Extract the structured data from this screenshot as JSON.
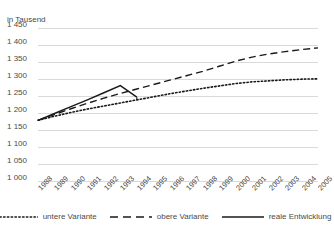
{
  "chart_data": {
    "type": "line",
    "title": "",
    "subtitle": "",
    "unit_label": "in Tausend",
    "xlabel": "",
    "ylabel": "",
    "ylim": [
      1000,
      1450
    ],
    "ytick_step": 50,
    "ytick_labels": [
      "1 450",
      "1 400",
      "1 350",
      "1 300",
      "1 250",
      "1 200",
      "1 150",
      "1 100",
      "1 050",
      "1 000"
    ],
    "ytick_values": [
      1450,
      1400,
      1350,
      1300,
      1250,
      1200,
      1150,
      1100,
      1050,
      1000
    ],
    "grid": true,
    "grid_color": "#d9d9d9",
    "legend_position": "bottom",
    "categories": [
      "1988",
      "1989",
      "1990",
      "1991",
      "1992",
      "1993",
      "1994",
      "1995",
      "1996",
      "1997",
      "1998",
      "1999",
      "2000",
      "2001",
      "2002",
      "2003",
      "2004",
      "2005"
    ],
    "x": [
      1988,
      1989,
      1990,
      1991,
      1992,
      1993,
      1994,
      1995,
      1996,
      1997,
      1998,
      1999,
      2000,
      2001,
      2002,
      2003,
      2004,
      2005
    ],
    "series": [
      {
        "name": "untere Variante",
        "style": "dotted",
        "color": "#1a1a1a",
        "values": [
          1180,
          1192,
          1203,
          1213,
          1222,
          1231,
          1240,
          1249,
          1258,
          1266,
          1274,
          1281,
          1288,
          1293,
          1296,
          1299,
          1301,
          1302
        ]
      },
      {
        "name": "obere Variante",
        "style": "dashed",
        "color": "#1a1a1a",
        "values": [
          1180,
          1197,
          1214,
          1230,
          1245,
          1259,
          1272,
          1285,
          1298,
          1311,
          1324,
          1339,
          1354,
          1366,
          1375,
          1382,
          1388,
          1393
        ]
      },
      {
        "name": "reale Entwicklung",
        "style": "solid",
        "color": "#1a1a1a",
        "values": [
          1180,
          1200,
          1220,
          1240,
          1261,
          1282,
          1248,
          null,
          null,
          null,
          null,
          null,
          null,
          null,
          null,
          null,
          null,
          null
        ]
      }
    ]
  },
  "legend": {
    "items": [
      {
        "label": "untere Variante",
        "style": "dotted"
      },
      {
        "label": "obere Variante",
        "style": "dashed"
      },
      {
        "label": "reale Entwicklung",
        "style": "solid"
      }
    ]
  }
}
